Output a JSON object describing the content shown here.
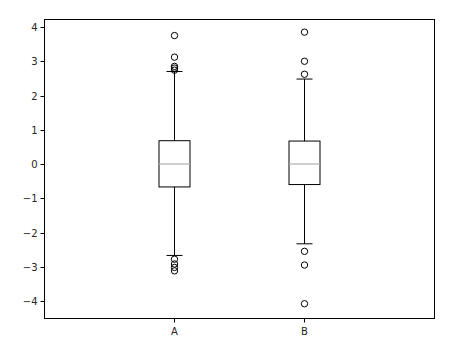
{
  "chart_data": {
    "type": "boxplot",
    "title": "",
    "xlabel": "",
    "ylabel": "",
    "categories": [
      "A",
      "B"
    ],
    "ylim": [
      -4.5,
      4.23
    ],
    "yticks": [
      4,
      3,
      2,
      1,
      0,
      -1,
      -2,
      -3,
      -4
    ],
    "ytick_labels": [
      "4",
      "3",
      "2",
      "1",
      "0",
      "−1",
      "−2",
      "−3",
      "−4"
    ],
    "grid": false,
    "legend": null,
    "series": [
      {
        "name": "A",
        "whisker_low": -2.67,
        "q1": -0.67,
        "median": 0.0,
        "q3": 0.68,
        "whisker_high": 2.7,
        "outliers": [
          3.75,
          3.12,
          2.85,
          2.8,
          2.74,
          -2.78,
          -2.92,
          -3.02,
          -3.12
        ]
      },
      {
        "name": "B",
        "whisker_low": -2.33,
        "q1": -0.6,
        "median": 0.0,
        "q3": 0.67,
        "whisker_high": 2.48,
        "outliers": [
          3.85,
          3.0,
          2.62,
          -2.55,
          -2.95,
          -4.08
        ]
      }
    ],
    "colors": {
      "box": "#000000",
      "median": "#b0b0b0",
      "frame": "#000000",
      "text": "#262626"
    }
  }
}
